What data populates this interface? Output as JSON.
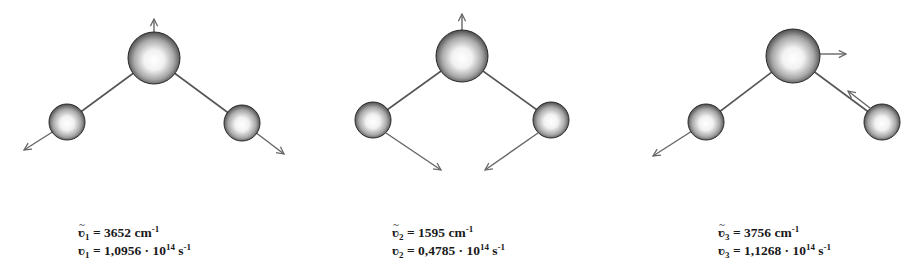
{
  "colors": {
    "bond": "#555555",
    "arrow": "#666666",
    "atom_edge": "#2a2a2a",
    "text": "#1a1a1a"
  },
  "modes": [
    {
      "id": 1,
      "symbol": "ʋ",
      "subscript": "1",
      "wavenumber_value": "3652",
      "wavenumber_unit": "cm",
      "wavenumber_exp": "-1",
      "frequency_value": "1,0956",
      "frequency_mult": "· 10",
      "frequency_exp": "14",
      "frequency_unit": "s",
      "frequency_unit_exp": "-1",
      "description": "symmetric stretch"
    },
    {
      "id": 2,
      "symbol": "ʋ",
      "subscript": "2",
      "wavenumber_value": "1595",
      "wavenumber_unit": "cm",
      "wavenumber_exp": "-1",
      "frequency_value": "0,4785",
      "frequency_mult": "· 10",
      "frequency_exp": "14",
      "frequency_unit": "s",
      "frequency_unit_exp": "-1",
      "description": "bending"
    },
    {
      "id": 3,
      "symbol": "ʋ",
      "subscript": "3",
      "wavenumber_value": "3756",
      "wavenumber_unit": "cm",
      "wavenumber_exp": "-1",
      "frequency_value": "1,1268",
      "frequency_mult": "· 10",
      "frequency_exp": "14",
      "frequency_unit": "s",
      "frequency_unit_exp": "-1",
      "description": "asymmetric stretch"
    }
  ]
}
